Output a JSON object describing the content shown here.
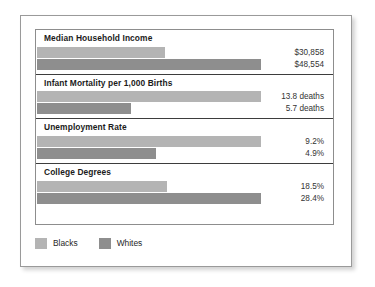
{
  "chart_data": {
    "type": "bar",
    "title": "",
    "subtitle": "",
    "xlabel": "",
    "ylabel": "",
    "orientation": "horizontal",
    "grid": false,
    "legend_position": "bottom-left",
    "categories": [
      "Median Household Income",
      "Infant Mortality per 1,000 Births",
      "Unemployment Rate",
      "College Degrees"
    ],
    "series": [
      {
        "name": "Blacks",
        "color": "#b4b4b4",
        "values": [
          30858,
          13.8,
          9.2,
          18.5
        ],
        "labels": [
          "$30,858",
          "13.8 deaths",
          "9.2%",
          "18.5%"
        ],
        "bar_pct": [
          57,
          100,
          100,
          58
        ]
      },
      {
        "name": "Whites",
        "color": "#8e8e8e",
        "values": [
          48554,
          5.7,
          4.9,
          28.4
        ],
        "labels": [
          "$48,554",
          "5.7 deaths",
          "4.9%",
          "28.4%"
        ],
        "bar_pct": [
          100,
          42,
          53,
          100
        ]
      }
    ],
    "groups": [
      {
        "title": "Median Household Income",
        "rows": [
          {
            "series": "Blacks",
            "label": "$30,858",
            "value": 30858,
            "bar_pct": 57
          },
          {
            "series": "Whites",
            "label": "$48,554",
            "value": 48554,
            "bar_pct": 100
          }
        ]
      },
      {
        "title": "Infant Mortality per 1,000 Births",
        "rows": [
          {
            "series": "Blacks",
            "label": "13.8 deaths",
            "value": 13.8,
            "bar_pct": 100
          },
          {
            "series": "Whites",
            "label": "5.7 deaths",
            "value": 5.7,
            "bar_pct": 42
          }
        ]
      },
      {
        "title": "Unemployment Rate",
        "rows": [
          {
            "series": "Blacks",
            "label": "9.2%",
            "value": 9.2,
            "bar_pct": 100
          },
          {
            "series": "Whites",
            "label": "4.9%",
            "value": 4.9,
            "bar_pct": 53
          }
        ]
      },
      {
        "title": "College Degrees",
        "rows": [
          {
            "series": "Blacks",
            "label": "18.5%",
            "value": 18.5,
            "bar_pct": 58
          },
          {
            "series": "Whites",
            "label": "28.4%",
            "value": 28.4,
            "bar_pct": 100
          }
        ]
      }
    ],
    "legend": [
      {
        "label": "Blacks",
        "color": "#b4b4b4"
      },
      {
        "label": "Whites",
        "color": "#8e8e8e"
      }
    ]
  },
  "colors": {
    "blacks_bar": "#b4b4b4",
    "whites_bar": "#8e8e8e",
    "frame_border": "#9a9a9a",
    "table_border": "#8d8d8d",
    "divider": "#3d3d3d",
    "title_text": "#1b1b1b",
    "value_text": "#333333",
    "background": "#ffffff"
  }
}
